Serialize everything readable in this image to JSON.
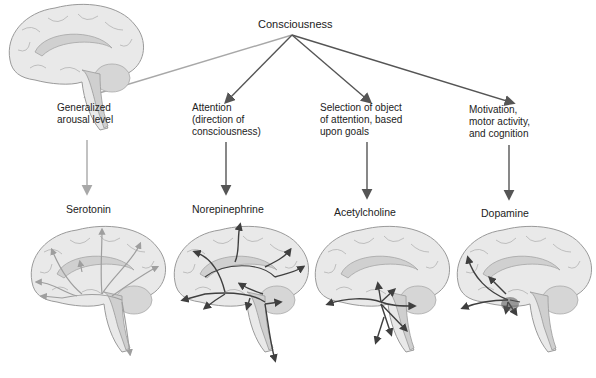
{
  "root": {
    "label": "Consciousness"
  },
  "branches": [
    {
      "function": "Generalized\narousal level",
      "neurotransmitter": "Serotonin",
      "arrow_color": "#a8a8a8"
    },
    {
      "function": "Attention\n(direction of\nconsciousness)",
      "neurotransmitter": "Norepinephrine",
      "arrow_color": "#555555"
    },
    {
      "function": "Selection of object\nof attention, based\nupon goals",
      "neurotransmitter": "Acetylcholine",
      "arrow_color": "#555555"
    },
    {
      "function": "Motivation,\nmotor activity,\nand cognition",
      "neurotransmitter": "Dopamine",
      "arrow_color": "#555555"
    }
  ],
  "colors": {
    "brain_fill": "#e9e9e9",
    "brain_stroke": "#9a9a9a",
    "pathway_light": "#9e9e9e",
    "pathway_dark": "#4a4a4a"
  }
}
